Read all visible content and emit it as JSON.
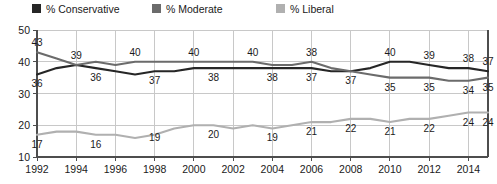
{
  "chart_data": {
    "type": "line",
    "title": "",
    "xlabel": "",
    "ylabel": "",
    "xlim": [
      1992,
      2015
    ],
    "ylim": [
      10,
      50
    ],
    "yticks": [
      10,
      20,
      30,
      40,
      50
    ],
    "gridlines": "horizontal-and-vertical",
    "legend_position": "top-center",
    "x": [
      1992,
      1993,
      1994,
      1995,
      1996,
      1997,
      1998,
      1999,
      2000,
      2001,
      2002,
      2003,
      2004,
      2005,
      2006,
      2007,
      2008,
      2009,
      2010,
      2011,
      2012,
      2013,
      2014,
      2015
    ],
    "xtick_labels": [
      "1992",
      "1994",
      "1996",
      "1998",
      "2000",
      "2002",
      "2004",
      "2006",
      "2008",
      "2010",
      "2012",
      "2014"
    ],
    "xtick_values": [
      1992,
      1994,
      1996,
      1998,
      2000,
      2002,
      2004,
      2006,
      2008,
      2010,
      2012,
      2014
    ],
    "series": [
      {
        "name": "% Conservative",
        "color": "#262626",
        "values": [
          36,
          38,
          39,
          38,
          37,
          36,
          37,
          37,
          38,
          38,
          38,
          38,
          38,
          38,
          38,
          37,
          37,
          38,
          40,
          40,
          39,
          38,
          38,
          37
        ],
        "labels": [
          {
            "x": 1992,
            "value": 36,
            "text": "36",
            "pos": "below"
          },
          {
            "x": 1995,
            "value": 38,
            "text": "36",
            "pos": "below"
          },
          {
            "x": 1998,
            "value": 37,
            "text": "37",
            "pos": "below"
          },
          {
            "x": 2001,
            "value": 38,
            "text": "38",
            "pos": "below"
          },
          {
            "x": 2004,
            "value": 38,
            "text": "38",
            "pos": "below"
          },
          {
            "x": 2006,
            "value": 38,
            "text": "37",
            "pos": "below"
          },
          {
            "x": 2008,
            "value": 37,
            "text": "37",
            "pos": "below"
          },
          {
            "x": 2010,
            "value": 40,
            "text": "40",
            "pos": "above"
          },
          {
            "x": 2012,
            "value": 39,
            "text": "39",
            "pos": "above"
          },
          {
            "x": 2014,
            "value": 38,
            "text": "38",
            "pos": "above"
          },
          {
            "x": 2015,
            "value": 37,
            "text": "37",
            "pos": "above"
          }
        ]
      },
      {
        "name": "% Moderate",
        "color": "#6b6b6b",
        "values": [
          43,
          41,
          39,
          40,
          39,
          40,
          40,
          40,
          40,
          40,
          40,
          40,
          39,
          39,
          40,
          38,
          37,
          36,
          35,
          35,
          35,
          34,
          34,
          35
        ],
        "labels": [
          {
            "x": 1992,
            "value": 43,
            "text": "43",
            "pos": "above"
          },
          {
            "x": 1994,
            "value": 39,
            "text": "39",
            "pos": "above"
          },
          {
            "x": 1997,
            "value": 40,
            "text": "40",
            "pos": "above"
          },
          {
            "x": 2000,
            "value": 40,
            "text": "40",
            "pos": "above"
          },
          {
            "x": 2003,
            "value": 40,
            "text": "40",
            "pos": "above"
          },
          {
            "x": 2006,
            "value": 40,
            "text": "38",
            "pos": "above"
          },
          {
            "x": 2010,
            "value": 35,
            "text": "35",
            "pos": "below"
          },
          {
            "x": 2012,
            "value": 35,
            "text": "35",
            "pos": "below"
          },
          {
            "x": 2014,
            "value": 34,
            "text": "34",
            "pos": "below"
          },
          {
            "x": 2015,
            "value": 35,
            "text": "35",
            "pos": "below"
          }
        ]
      },
      {
        "name": "% Liberal",
        "color": "#b0b0b0",
        "values": [
          17,
          18,
          18,
          17,
          17,
          16,
          17,
          19,
          20,
          20,
          19,
          20,
          19,
          20,
          21,
          21,
          22,
          22,
          21,
          22,
          22,
          23,
          24,
          24
        ],
        "labels": [
          {
            "x": 1992,
            "value": 17,
            "text": "17",
            "pos": "below"
          },
          {
            "x": 1995,
            "value": 17,
            "text": "16",
            "pos": "below"
          },
          {
            "x": 1998,
            "value": 19,
            "text": "19",
            "pos": "below"
          },
          {
            "x": 2001,
            "value": 20,
            "text": "20",
            "pos": "below"
          },
          {
            "x": 2004,
            "value": 19,
            "text": "19",
            "pos": "below"
          },
          {
            "x": 2006,
            "value": 21,
            "text": "21",
            "pos": "below"
          },
          {
            "x": 2008,
            "value": 22,
            "text": "22",
            "pos": "below"
          },
          {
            "x": 2010,
            "value": 21,
            "text": "21",
            "pos": "below"
          },
          {
            "x": 2012,
            "value": 22,
            "text": "22",
            "pos": "below"
          },
          {
            "x": 2014,
            "value": 24,
            "text": "24",
            "pos": "below"
          },
          {
            "x": 2015,
            "value": 24,
            "text": "24",
            "pos": "below"
          }
        ]
      }
    ]
  },
  "legend": {
    "items": [
      {
        "label": "% Conservative",
        "color": "#262626"
      },
      {
        "label": "% Moderate",
        "color": "#6b6b6b"
      },
      {
        "label": "% Liberal",
        "color": "#b0b0b0"
      }
    ]
  }
}
